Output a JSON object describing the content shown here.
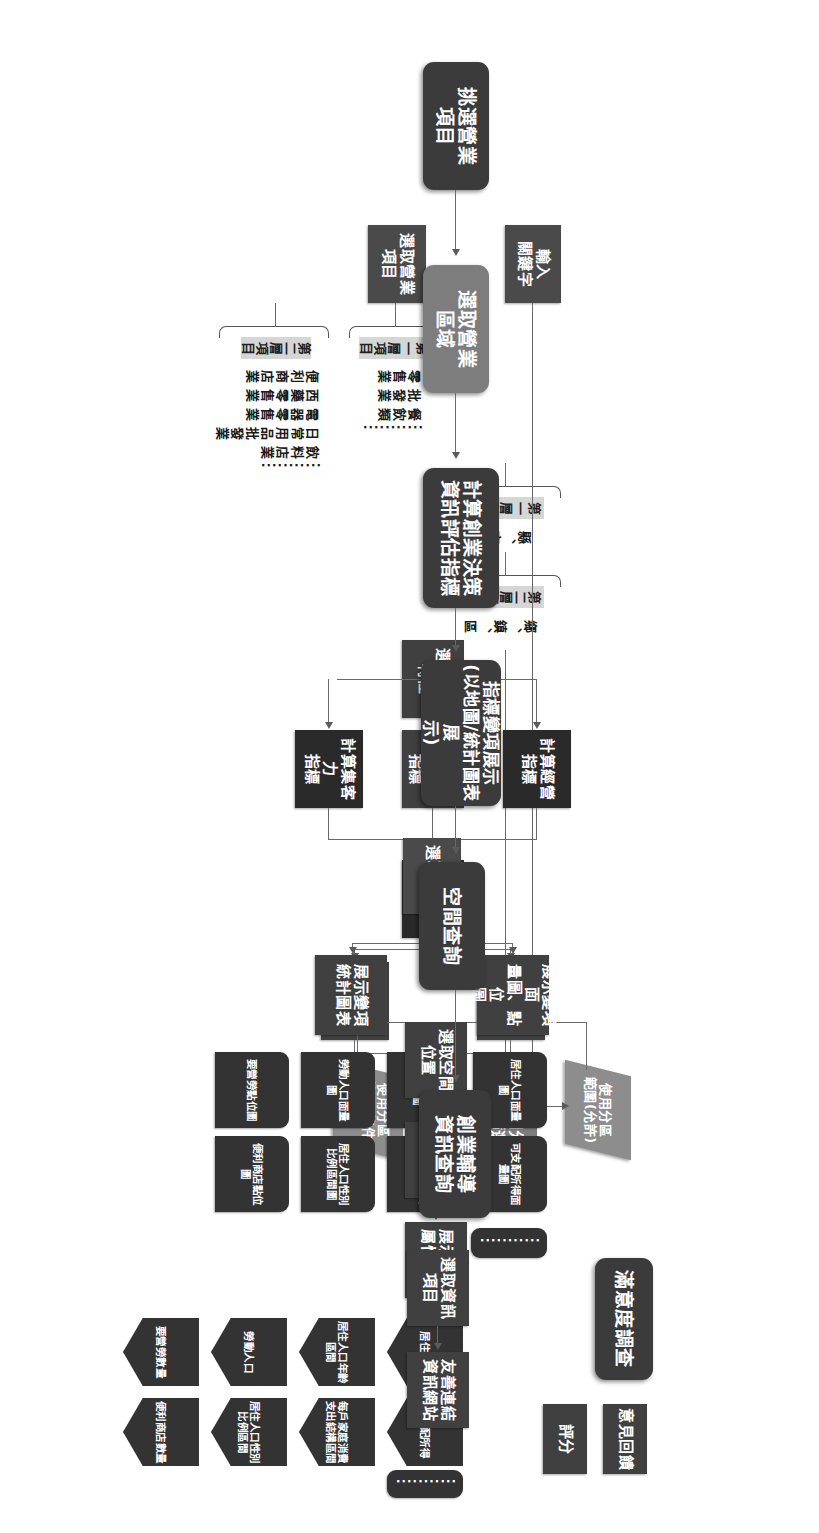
{
  "diagram": {
    "colors": {
      "header_dark": "#3b3b3b",
      "header_grey": "#7d7d7d",
      "step": "#404040",
      "attribute": "#333333",
      "parallelogram": "#8d8d8d",
      "label_grey": "#d6d6d6",
      "line": "#6a6a6a",
      "background": "#ffffff"
    },
    "stages": [
      {
        "id": "pick-business-item",
        "label": "挑選營業\n項目",
        "style": "dark"
      },
      {
        "id": "pick-business-area",
        "label": "選取營業\n區域",
        "style": "grey"
      },
      {
        "id": "calc-startup-decision",
        "label": "計算創業決策\n資訊評估指標",
        "style": "dark"
      },
      {
        "id": "indicator-display",
        "label": "指標變項展示\n(以地圖/統計圖表展\n示)",
        "style": "dark"
      },
      {
        "id": "spatial-query",
        "label": "空間查詢",
        "style": "dark"
      },
      {
        "id": "startup-info-query",
        "label": "創業輔導\n資訊查詢",
        "style": "dark"
      },
      {
        "id": "satisfaction-survey",
        "label": "滿意度調查",
        "style": "dark"
      }
    ],
    "steps": {
      "input_keyword": "輸入\n關鍵字",
      "select_business_item": "選取營業\n項目",
      "land_use_filter": "土地使用分\n區管制篩選",
      "select_industry_trait": "選取行業\n特性",
      "calc_consumption": "計算消費力\n指標",
      "calc_management": "計算經營\n指標",
      "calc_attraction": "計算集客力\n指標",
      "calc_composite": "計算綜合\n指標",
      "show_composite_map": "展示綜合指\n標面量圖",
      "show_single_map": "展示單項指\n標面量圖",
      "select_variable": "選取變項",
      "show_variable_map": "展示變項面\n量圖、點位\n圖",
      "show_variable_chart": "展示變項\n統計圖表",
      "select_spatial_location": "選取空間\n位置",
      "set_search_radius": "設定搜尋\n半徑",
      "show_variable_attributes": "展示變項\n屬性資料",
      "select_info_item": "選取資訊\n項目",
      "friendly_links": "友善連結\n資訊網站",
      "feedback": "意見回饋",
      "rating": "評分"
    },
    "parallelograms": [
      {
        "id": "zoning-conditional",
        "label": "使用分區\n範圍(條件\n允許)"
      },
      {
        "id": "zoning-allowed",
        "label": "使用分區\n範圍(允許)"
      }
    ],
    "tier_labels": {
      "tier1": "第一層項目",
      "tier2": "第二層項目"
    },
    "business_item_lists": {
      "tier1": [
        "零售業",
        "批發業",
        "餐飲類"
      ],
      "tier2": [
        "便利商店業",
        "西藥零售業",
        "電器零售業",
        "日常用品批發業",
        "飲料店業"
      ]
    },
    "area_lists": {
      "tier1": "縣、市",
      "tier2": "鄉、鎮、區"
    },
    "map_variables": [
      "居住人口面量圖",
      "居住人口年齡區間圖",
      "勞動人口面量圖",
      "要營勞點位圖",
      "可支配所得面量圖",
      "每戶家庭消費支出結構區間圖",
      "居住人口性別比例區間圖",
      "便利商店點位圖"
    ],
    "spatial_attributes": [
      "居住人口",
      "居住人口年齡區間",
      "勞動人口",
      "要營勞數量",
      "可支配所得",
      "每戶家庭消費支出結構區間",
      "居住人口性別比例區間",
      "便利商店數量"
    ],
    "ellipsis": "..........."
  }
}
